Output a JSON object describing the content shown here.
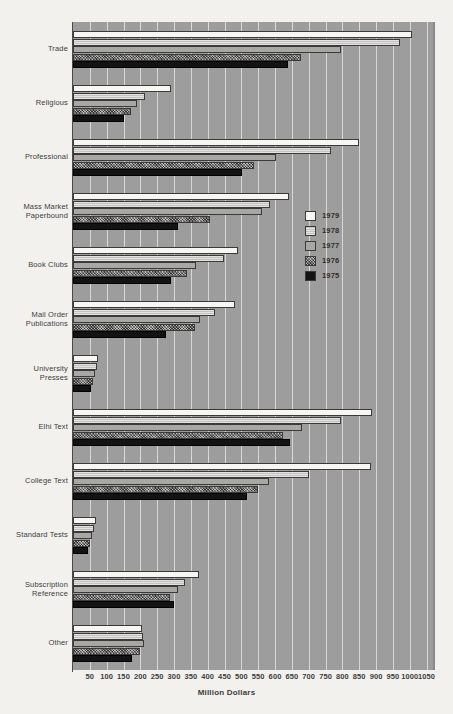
{
  "chart_data": {
    "type": "bar",
    "orientation": "horizontal",
    "title": "",
    "xlabel": "Million Dollars",
    "ylabel": "",
    "xlim": [
      0,
      1075
    ],
    "xticks": [
      50,
      100,
      150,
      200,
      250,
      300,
      350,
      400,
      450,
      500,
      550,
      600,
      650,
      700,
      750,
      800,
      850,
      900,
      950,
      1000,
      1050
    ],
    "grid": true,
    "legend_position": "center-right",
    "categories": [
      "Trade",
      "Religious",
      "Professional",
      "Mass Market Paperbound",
      "Book Clubs",
      "Mail Order Publications",
      "University Presses",
      "Elhi Text",
      "College Text",
      "Standard Tests",
      "Subscription Reference",
      "Other"
    ],
    "series": [
      {
        "name": "1979",
        "color": "#f7f6f2",
        "values": [
          1006,
          290,
          850,
          640,
          490,
          480,
          75,
          887,
          884,
          68,
          375,
          204
        ]
      },
      {
        "name": "1978",
        "color": "#c3c2be",
        "values": [
          972,
          215,
          765,
          585,
          448,
          422,
          70,
          795,
          700,
          62,
          334,
          209
        ]
      },
      {
        "name": "1977",
        "color": "#a8a7a3",
        "values": [
          796,
          190,
          602,
          560,
          364,
          378,
          65,
          680,
          582,
          56,
          311,
          212
        ]
      },
      {
        "name": "1976",
        "color": "#7e7d7a",
        "values": [
          678,
          172,
          538,
          407,
          340,
          361,
          58,
          625,
          550,
          50,
          288,
          198
        ]
      },
      {
        "name": "1975",
        "color": "#131313",
        "values": [
          638,
          152,
          503,
          311,
          291,
          276,
          52,
          645,
          518,
          44,
          300,
          174
        ]
      }
    ]
  },
  "legend": {
    "entries": [
      {
        "label": "1979",
        "swatch": "sw-1979"
      },
      {
        "label": "1978",
        "swatch": "sw-1978"
      },
      {
        "label": "1977",
        "swatch": "sw-1977"
      },
      {
        "label": "1976",
        "swatch": "sw-1976"
      },
      {
        "label": "1975",
        "swatch": "sw-1975"
      }
    ]
  },
  "axis": {
    "x_title": "Million Dollars"
  }
}
